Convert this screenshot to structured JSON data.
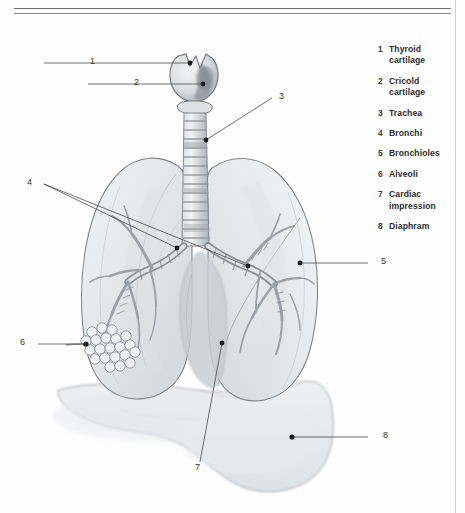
{
  "page": {
    "background_color": "#fefefe",
    "rule_color": "#6e6e6e"
  },
  "legend": {
    "items": [
      {
        "num": "1",
        "label": "Thyroid cartilage"
      },
      {
        "num": "2",
        "label": "Cricold cartilage"
      },
      {
        "num": "3",
        "label": "Trachea"
      },
      {
        "num": "4",
        "label": "Bronchi"
      },
      {
        "num": "5",
        "label": "Bronchioles"
      },
      {
        "num": "6",
        "label": "Alveoli"
      },
      {
        "num": "7",
        "label": "Cardiac impression"
      },
      {
        "num": "8",
        "label": "Diaphram"
      }
    ]
  },
  "callouts": [
    {
      "num": "1",
      "target": "thyroid-cartilage",
      "x": 92,
      "y": 63
    },
    {
      "num": "2",
      "target": "cricoid-cartilage",
      "x": 137,
      "y": 83
    },
    {
      "num": "3",
      "target": "trachea",
      "x": 281,
      "y": 97
    },
    {
      "num": "4",
      "target": "bronchi",
      "x": 29,
      "y": 182
    },
    {
      "num": "5",
      "target": "bronchioles",
      "x": 383,
      "y": 264
    },
    {
      "num": "6",
      "target": "alveoli",
      "x": 22,
      "y": 345
    },
    {
      "num": "7",
      "target": "cardiac-impression",
      "x": 197,
      "y": 470
    },
    {
      "num": "8",
      "target": "diaphragm",
      "x": 385,
      "y": 437
    }
  ],
  "illustration": {
    "type": "anatomical-drawing",
    "subject": "human lungs, trachea and bronchial tree with diaphragm",
    "style": "grayscale watercolor and pencil",
    "ink_color": "#6b7076",
    "wash_light": "#eceef0",
    "wash_mid": "#dfe3e6",
    "wash_dark": "#b9bfc5"
  }
}
